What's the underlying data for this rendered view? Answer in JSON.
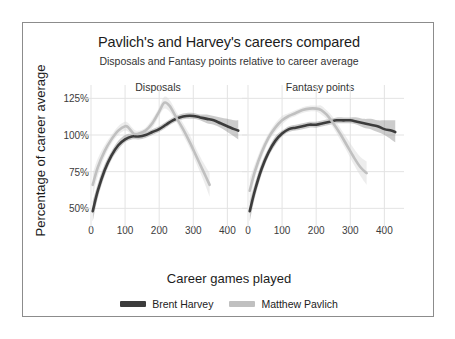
{
  "chart_data": {
    "type": "line",
    "title": "Pavlich's and Harvey's careers compared",
    "subtitle": "Disposals and Fantasy points relative to career average",
    "xlabel": "Career games played",
    "ylabel": "Percentage of career average",
    "xlim": [
      0,
      440
    ],
    "ylim": [
      40,
      130
    ],
    "xticks": [
      0,
      100,
      200,
      300,
      400
    ],
    "xtick_labels": [
      "0",
      "100",
      "200",
      "300",
      "400"
    ],
    "yticks": [
      50,
      75,
      100,
      125
    ],
    "ytick_labels": [
      "50%",
      "75%",
      "100%",
      "125%"
    ],
    "grid": true,
    "legend_position": "bottom",
    "facets": [
      {
        "id": "disposals",
        "label": "Disposals"
      },
      {
        "id": "fantasy",
        "label": "Fantasy points"
      }
    ],
    "legend": [
      {
        "name": "Brent Harvey",
        "color": "#3c3c3c"
      },
      {
        "name": "Matthew Pavlich",
        "color": "#c0c0c0"
      }
    ],
    "panels": [
      {
        "facet": "disposals",
        "series": [
          {
            "name": "Brent Harvey",
            "color": "#3c3c3c",
            "ribbon_color": "#8f8f8f",
            "x": [
              5,
              20,
              40,
              60,
              80,
              100,
              120,
              140,
              160,
              180,
              200,
              220,
              240,
              260,
              280,
              300,
              320,
              340,
              360,
              380,
              400,
              420,
              432
            ],
            "y": [
              48,
              62,
              76,
              86,
              93,
              97,
              99,
              99,
              100,
              102,
              104,
              107,
              110,
              112,
              113,
              113,
              112,
              111,
              110,
              108,
              106,
              104,
              103
            ],
            "y_low": [
              41,
              57,
              72,
              83,
              90,
              95,
              97,
              97,
              98,
              100,
              102,
              105,
              108,
              110,
              111,
              111,
              110,
              108,
              107,
              105,
              102,
              99,
              97
            ],
            "y_high": [
              55,
              67,
              80,
              89,
              96,
              100,
              101,
              101,
              102,
              104,
              106,
              109,
              112,
              114,
              115,
              115,
              114,
              114,
              113,
              112,
              111,
              110,
              110
            ]
          },
          {
            "name": "Matthew Pavlich",
            "color": "#c0c0c0",
            "ribbon_color": "#d8d8d8",
            "x": [
              5,
              20,
              40,
              60,
              80,
              100,
              110,
              125,
              140,
              160,
              180,
              200,
              215,
              230,
              250,
              270,
              290,
              310,
              330,
              348
            ],
            "y": [
              66,
              78,
              89,
              97,
              103,
              106,
              105,
              101,
              101,
              103,
              108,
              116,
              122,
              120,
              112,
              104,
              95,
              85,
              75,
              66
            ],
            "y_low": [
              58,
              72,
              85,
              94,
              100,
              103,
              102,
              99,
              99,
              101,
              105,
              113,
              118,
              116,
              109,
              100,
              91,
              80,
              69,
              58
            ],
            "y_high": [
              74,
              84,
              93,
              100,
              106,
              109,
              108,
              104,
              103,
              105,
              111,
              119,
              126,
              124,
              116,
              108,
              100,
              90,
              81,
              74
            ]
          }
        ]
      },
      {
        "facet": "fantasy",
        "series": [
          {
            "name": "Brent Harvey",
            "color": "#3c3c3c",
            "ribbon_color": "#8f8f8f",
            "x": [
              5,
              20,
              40,
              60,
              80,
              100,
              120,
              140,
              160,
              180,
              200,
              220,
              240,
              260,
              280,
              300,
              320,
              340,
              360,
              380,
              400,
              420,
              432
            ],
            "y": [
              48,
              62,
              77,
              88,
              96,
              101,
              104,
              105,
              106,
              107,
              107,
              108,
              109,
              110,
              110,
              110,
              109,
              108,
              107,
              106,
              104,
              103,
              102
            ],
            "y_low": [
              41,
              57,
              73,
              85,
              93,
              99,
              102,
              103,
              104,
              105,
              105,
              106,
              107,
              108,
              108,
              108,
              107,
              105,
              104,
              102,
              100,
              97,
              95
            ],
            "y_high": [
              55,
              67,
              81,
              91,
              99,
              103,
              106,
              107,
              108,
              109,
              109,
              110,
              111,
              112,
              112,
              112,
              112,
              111,
              111,
              110,
              110,
              110,
              110
            ]
          },
          {
            "name": "Matthew Pavlich",
            "color": "#c0c0c0",
            "ribbon_color": "#d8d8d8",
            "x": [
              5,
              20,
              40,
              60,
              80,
              100,
              120,
              140,
              160,
              180,
              200,
              215,
              230,
              250,
              270,
              290,
              310,
              330,
              348
            ],
            "y": [
              62,
              75,
              88,
              98,
              105,
              110,
              113,
              115,
              117,
              118,
              118,
              117,
              114,
              108,
              101,
              93,
              85,
              78,
              74
            ],
            "y_low": [
              54,
              70,
              84,
              95,
              102,
              107,
              111,
              113,
              115,
              116,
              116,
              114,
              111,
              105,
              97,
              89,
              80,
              72,
              66
            ],
            "y_high": [
              70,
              80,
              92,
              101,
              108,
              113,
              115,
              117,
              119,
              120,
              120,
              120,
              117,
              112,
              105,
              98,
              91,
              85,
              82
            ]
          }
        ]
      }
    ]
  },
  "frame": {
    "border_color": "#8c8c8c"
  }
}
